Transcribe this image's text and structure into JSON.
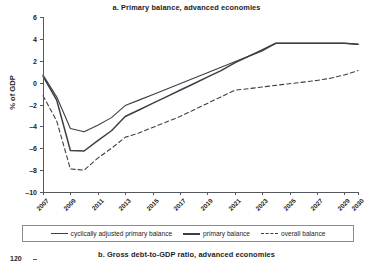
{
  "figure": {
    "panel_a_title": "a. Primary balance, advanced economies",
    "panel_b_title": "b. Gross debt-to-GDP ratio, advanced economies",
    "panel_b_first_ytick": "120"
  },
  "legend": {
    "items": [
      {
        "label": "cyclically adjusted primary balance",
        "style": "solid-thin"
      },
      {
        "label": "primary balance",
        "style": "solid-thick"
      },
      {
        "label": "overall balance",
        "style": "dashed"
      }
    ]
  },
  "chart_data": {
    "type": "line",
    "title": "a. Primary balance, advanced economies",
    "xlabel": "",
    "ylabel": "% of GDP",
    "ylim": [
      -10,
      6
    ],
    "yticks": [
      6,
      4,
      2,
      0,
      -2,
      -4,
      -6,
      -8,
      -10
    ],
    "ytick_labels": [
      "6",
      "4",
      "2",
      "0",
      "-2",
      "-4",
      "-6",
      "-8",
      "-10"
    ],
    "xlim": [
      2007,
      2030
    ],
    "xticks": [
      2007,
      2009,
      2011,
      2013,
      2015,
      2017,
      2019,
      2021,
      2023,
      2025,
      2027,
      2029,
      2030
    ],
    "xtick_labels": [
      "2007",
      "2009",
      "2011",
      "2013",
      "2015",
      "2017",
      "2019",
      "2021",
      "2023",
      "2025",
      "2027",
      "2029",
      "2030"
    ],
    "grid": false,
    "legend_position": "below-axes",
    "x": [
      2007,
      2008,
      2009,
      2010,
      2011,
      2012,
      2013,
      2014,
      2015,
      2016,
      2017,
      2018,
      2019,
      2020,
      2021,
      2022,
      2023,
      2024,
      2025,
      2026,
      2027,
      2028,
      2029,
      2030
    ],
    "series": [
      {
        "name": "cyclically adjusted primary balance",
        "style": "solid",
        "values": [
          0.7,
          -1.3,
          -4.2,
          -4.5,
          -3.9,
          -3.2,
          -2.1,
          -1.6,
          -1.1,
          -0.6,
          -0.1,
          0.4,
          0.9,
          1.4,
          1.9,
          2.4,
          2.9,
          3.6,
          3.6,
          3.6,
          3.6,
          3.6,
          3.6,
          3.5
        ]
      },
      {
        "name": "primary balance",
        "style": "solid",
        "values": [
          0.6,
          -1.6,
          -6.2,
          -6.25,
          -5.3,
          -4.4,
          -3.1,
          -2.5,
          -1.9,
          -1.3,
          -0.7,
          -0.1,
          0.5,
          1.1,
          1.8,
          2.4,
          3.0,
          3.6,
          3.6,
          3.6,
          3.6,
          3.6,
          3.6,
          3.5
        ]
      },
      {
        "name": "overall balance",
        "style": "dashed",
        "values": [
          -1.2,
          -3.5,
          -7.9,
          -8.0,
          -6.9,
          -6.0,
          -5.0,
          -4.6,
          -4.1,
          -3.6,
          -3.1,
          -2.5,
          -1.9,
          -1.3,
          -0.7,
          -0.55,
          -0.4,
          -0.25,
          -0.1,
          0.05,
          0.2,
          0.4,
          0.7,
          1.1
        ]
      }
    ]
  }
}
